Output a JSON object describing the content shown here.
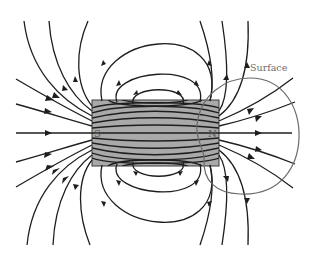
{
  "figure": {
    "magnet": {
      "south_label": "S",
      "north_label": "N",
      "fill_color": "#a9a9a9",
      "stroke_color": "#3a3a3a"
    },
    "surface": {
      "label": "Surface",
      "stroke_color": "#6a6a6a"
    },
    "field_line_color": "#1e1e1e"
  }
}
